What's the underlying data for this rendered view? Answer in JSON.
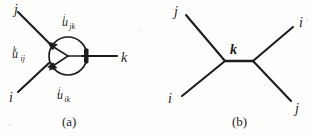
{
  "figure": {
    "kind": "two-panel-diagram",
    "background_color": "#fdfdfc",
    "ink_color": "#1d1d1d",
    "panels": [
      {
        "id": "a",
        "caption": "(a)",
        "description": "one-loop circle diagram with three external legs and three vertex couplings",
        "external_labels": [
          {
            "name": "j",
            "text": "j",
            "position": "top-left"
          },
          {
            "name": "i",
            "text": "i",
            "position": "bottom-left"
          },
          {
            "name": "k",
            "text": "k",
            "position": "right"
          }
        ],
        "vertex_labels": [
          {
            "name": "u-jk-i",
            "base": "u",
            "sub": "jk",
            "sup": "i",
            "position": "top"
          },
          {
            "name": "u-ij-k",
            "base": "u",
            "sub": "ij",
            "sup": "k",
            "position": "left"
          },
          {
            "name": "u-ik-j",
            "base": "u",
            "sub": "ik",
            "sup": "j",
            "position": "bottom"
          }
        ]
      },
      {
        "id": "b",
        "caption": "(b)",
        "description": "tree-level four-point diagram with internal propagator",
        "external_labels": [
          {
            "name": "j-upper-left",
            "text": "j",
            "position": "top-left"
          },
          {
            "name": "i-upper-right",
            "text": "i",
            "position": "top-right"
          },
          {
            "name": "i-lower-left",
            "text": "i",
            "position": "bottom-left"
          },
          {
            "name": "j-lower-right",
            "text": "j",
            "position": "bottom-right"
          }
        ],
        "internal_labels": [
          {
            "name": "k-propagator",
            "text": "k",
            "position": "center-above"
          }
        ]
      }
    ]
  }
}
